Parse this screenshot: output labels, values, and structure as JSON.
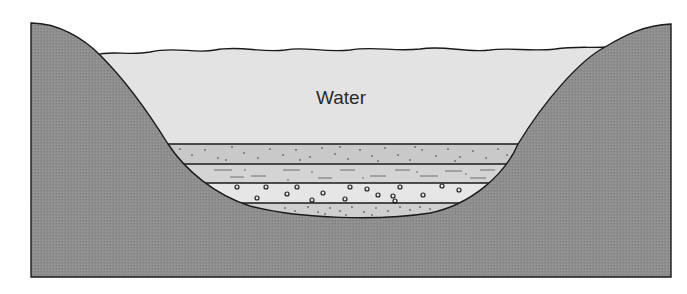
{
  "diagram": {
    "labels": {
      "water": "Water"
    },
    "regions": [
      {
        "name": "bedrock",
        "color": "#8f8f8f"
      },
      {
        "name": "water",
        "color": "#e3e3e3"
      },
      {
        "name": "fine-sand-layer",
        "color": "#c9c9c9"
      },
      {
        "name": "silt-layer",
        "color": "#d4d4d4"
      },
      {
        "name": "gravel-layer",
        "color": "#e6e6e6"
      },
      {
        "name": "sandy-bottom-layer",
        "color": "#cfcfcf"
      }
    ],
    "outline_color": "#1a1a1a"
  }
}
